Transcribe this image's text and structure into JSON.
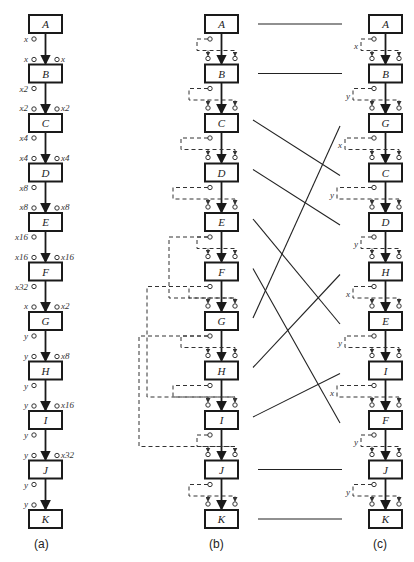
{
  "diagram": {
    "panels": [
      {
        "id": "a",
        "caption": "(a)",
        "nodes": [
          "A",
          "B",
          "C",
          "D",
          "E",
          "F",
          "G",
          "H",
          "I",
          "J",
          "K"
        ],
        "output_labels": [
          "x",
          "x2",
          "x4",
          "x8",
          "x16",
          "x32",
          "y",
          "y",
          "y",
          "y",
          ""
        ],
        "input_left_labels": [
          "",
          "x",
          "x2",
          "x4",
          "x8",
          "x16",
          "x",
          "y",
          "y",
          "y",
          "y"
        ],
        "input_right_labels": [
          "",
          "x",
          "x2",
          "x4",
          "x8",
          "x16",
          "x2",
          "x8",
          "x16",
          "x32",
          ""
        ]
      },
      {
        "id": "b",
        "caption": "(b)",
        "nodes": [
          "A",
          "B",
          "C",
          "D",
          "E",
          "F",
          "G",
          "H",
          "I",
          "J",
          "K"
        ]
      },
      {
        "id": "c",
        "caption": "(c)",
        "nodes": [
          "A",
          "B",
          "G",
          "C",
          "D",
          "H",
          "E",
          "I",
          "F",
          "J",
          "K"
        ],
        "side_labels": [
          "x",
          "y",
          "x",
          "y",
          "y",
          "x",
          "y",
          "x",
          "y",
          "y"
        ]
      }
    ],
    "mapping_b_to_c": [
      {
        "from": "A",
        "b_index": 0,
        "c_index": 0
      },
      {
        "from": "B",
        "b_index": 1,
        "c_index": 1
      },
      {
        "from": "C",
        "b_index": 2,
        "c_index": 3
      },
      {
        "from": "D",
        "b_index": 3,
        "c_index": 4
      },
      {
        "from": "E",
        "b_index": 4,
        "c_index": 6
      },
      {
        "from": "F",
        "b_index": 5,
        "c_index": 8
      },
      {
        "from": "G",
        "b_index": 6,
        "c_index": 2
      },
      {
        "from": "H",
        "b_index": 7,
        "c_index": 5
      },
      {
        "from": "I",
        "b_index": 8,
        "c_index": 7
      },
      {
        "from": "J",
        "b_index": 9,
        "c_index": 9
      },
      {
        "from": "K",
        "b_index": 10,
        "c_index": 10
      }
    ],
    "colors": {
      "ink": "#1a1a1a",
      "background": "#ffffff"
    }
  }
}
